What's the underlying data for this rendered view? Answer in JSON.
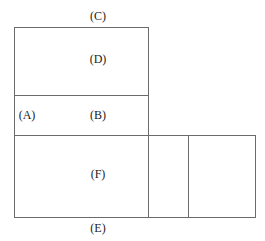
{
  "diagram": {
    "type": "net-of-cube-like box layout",
    "labels": {
      "C": "(C)",
      "D": "(D)",
      "A": "(A)",
      "B": "(B)",
      "F": "(F)",
      "E": "(E)"
    },
    "line_color": "#6b6b6b",
    "regions": [
      {
        "name": "D",
        "x": 14,
        "y": 27,
        "w": 134,
        "h": 68
      },
      {
        "name": "B",
        "x": 14,
        "y": 95,
        "w": 134,
        "h": 40
      },
      {
        "name": "F",
        "x": 14,
        "y": 135,
        "w": 134,
        "h": 82
      },
      {
        "name": "unlabeled-small",
        "x": 148,
        "y": 135,
        "w": 40,
        "h": 82
      },
      {
        "name": "unlabeled-right",
        "x": 188,
        "y": 135,
        "w": 67,
        "h": 82
      }
    ]
  }
}
